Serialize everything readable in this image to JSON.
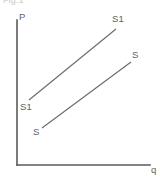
{
  "figure": {
    "caption": "Fig.1",
    "background_color": "#ffffff",
    "line_color": "#6b6b6b",
    "axis_color": "#5a5a5a",
    "width": 160,
    "height": 178
  },
  "axes": {
    "y_axis_label": "P",
    "x_axis_label": "q",
    "origin": {
      "x": 17,
      "y": 165
    },
    "y_axis_top": {
      "x": 17,
      "y": 20
    },
    "x_axis_right": {
      "x": 150,
      "y": 165
    }
  },
  "labels": {
    "s1_top_right": "S1",
    "s_right": "S",
    "s1_left": "S1",
    "s_bottom": "S"
  },
  "chart_data": {
    "type": "line",
    "title": "Fig.1",
    "xlabel": "q",
    "ylabel": "P",
    "grid": false,
    "legend": "inline-endpoint-labels",
    "axis_arrows": false,
    "series": [
      {
        "name": "S1",
        "label_start": "S1",
        "label_end": "S1",
        "points": [
          {
            "x": 29,
            "y": 100
          },
          {
            "x": 116,
            "y": 29
          }
        ]
      },
      {
        "name": "S",
        "label_start": "S",
        "label_end": "S",
        "points": [
          {
            "x": 42,
            "y": 128
          },
          {
            "x": 131,
            "y": 62
          }
        ]
      }
    ]
  }
}
